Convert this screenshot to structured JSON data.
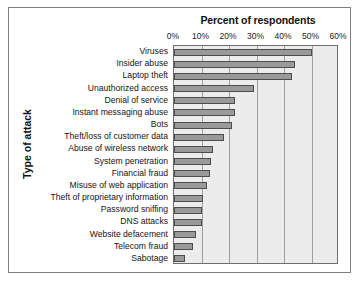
{
  "chart_data": {
    "type": "bar",
    "orientation": "horizontal",
    "title": "Percent of respondents",
    "xlabel": "Percent of respondents",
    "ylabel": "Type of attack",
    "xlim": [
      0,
      60
    ],
    "xticks": [
      "0%",
      "10%",
      "20%",
      "30%",
      "40%",
      "50%",
      "60%"
    ],
    "xtick_values": [
      0,
      10,
      20,
      30,
      40,
      50,
      60
    ],
    "grid": true,
    "legend": "none",
    "categories": [
      "Viruses",
      "Insider abuse",
      "Laptop theft",
      "Unauthorized access",
      "Denial of service",
      "Instant messaging abuse",
      "Bots",
      "Theft/loss of customer data",
      "Abuse of wireless network",
      "System penetration",
      "Financial fraud",
      "Misuse of web application",
      "Theft of proprietary information",
      "Password sniffing",
      "DNS attacks",
      "Website defacement",
      "Telecom fraud",
      "Sabotage"
    ],
    "values": [
      50,
      44,
      43,
      29,
      22,
      22,
      21,
      18,
      14,
      13.5,
      13,
      12,
      10.5,
      10,
      10,
      8,
      7,
      4
    ],
    "bar_color": "#9a9a9a",
    "bar_edge_color": "#4d4d4d",
    "plot_background": "#ececec"
  }
}
